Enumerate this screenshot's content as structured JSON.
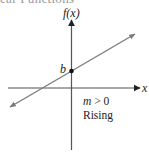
{
  "header": {
    "title_partial": "ear Functions"
  },
  "diagram": {
    "y_axis_label": "f(x)",
    "x_axis_label": "x",
    "intercept_label": "b",
    "slope_condition": "m > 0",
    "description": "Rising",
    "colors": {
      "axes": "#555555",
      "line": "#7a7a7a",
      "point": "#111111",
      "text": "#222222"
    }
  }
}
